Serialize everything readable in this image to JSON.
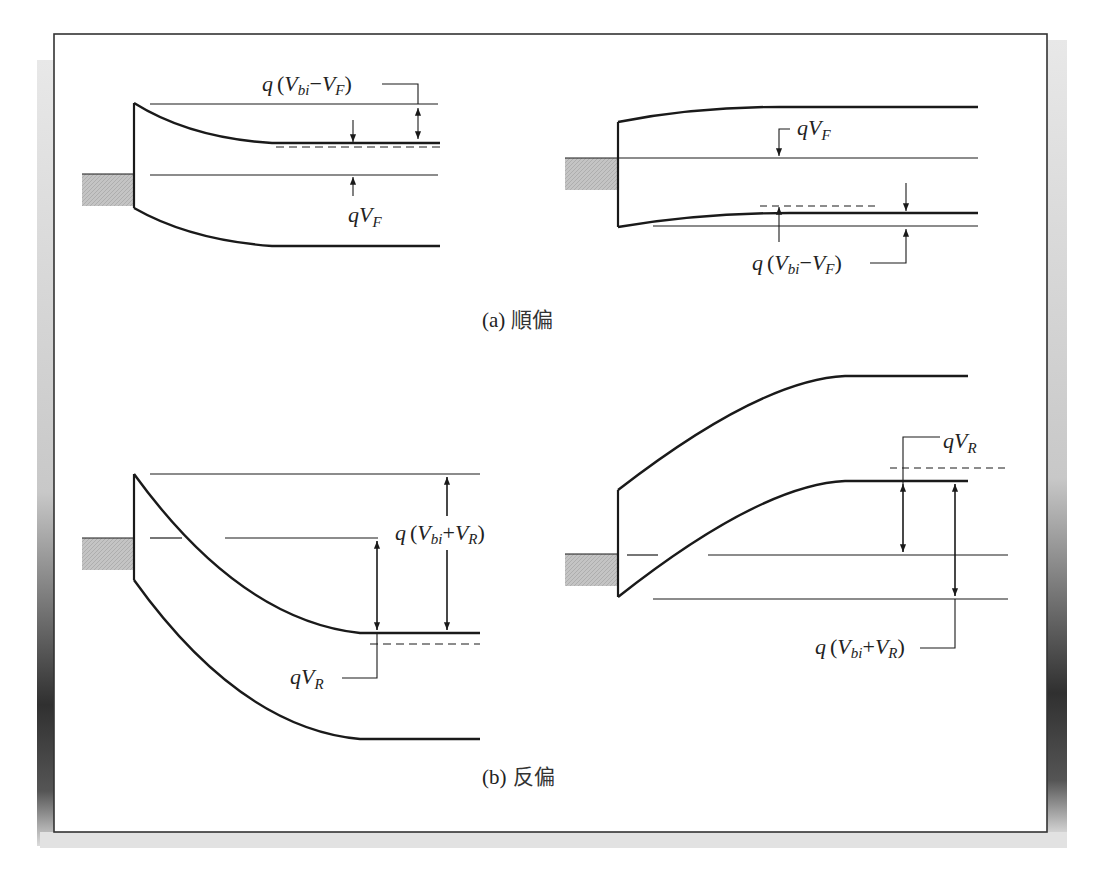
{
  "figure": {
    "colors": {
      "line": "#1a1a1a",
      "metal_fill": "#bdbdbd",
      "frame": "#333333",
      "shadow_dark": "#111111",
      "shadow_light": "#e6e6e6"
    },
    "panel_a": {
      "caption_prefix": "(a)",
      "caption_text": "順偏",
      "left": {
        "label_top": {
          "q": "q",
          "open": "(",
          "V1": "V",
          "s1": "bi",
          "op": "−",
          "V2": "V",
          "s2": "F",
          "close": ")"
        },
        "label_bottom": {
          "q": "q",
          "V": "V",
          "s": "F"
        }
      },
      "right": {
        "label_top": {
          "q": "q",
          "V": "V",
          "s": "F"
        },
        "label_bottom": {
          "q": "q",
          "open": "(",
          "V1": "V",
          "s1": "bi",
          "op": "−",
          "V2": "V",
          "s2": "F",
          "close": ")"
        }
      }
    },
    "panel_b": {
      "caption_prefix": "(b)",
      "caption_text": "反偏",
      "left": {
        "label_right": {
          "q": "q",
          "open": "(",
          "V1": "V",
          "s1": "bi",
          "op": "+",
          "V2": "V",
          "s2": "R",
          "close": ")"
        },
        "label_bottom": {
          "q": "q",
          "V": "V",
          "s": "R"
        }
      },
      "right": {
        "label_top": {
          "q": "q",
          "V": "V",
          "s": "R"
        },
        "label_bottom": {
          "q": "q",
          "open": "(",
          "V1": "V",
          "s1": "bi",
          "op": "+",
          "V2": "V",
          "s2": "R",
          "close": ")"
        }
      }
    }
  }
}
